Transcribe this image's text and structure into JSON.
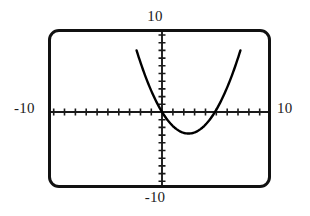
{
  "widget": {
    "name": "graphing-calculator-viewport",
    "frame_color": "#111111",
    "curve_color": "#000000",
    "axis_color": "#1a1a1a",
    "background": "#ffffff"
  },
  "labels": {
    "y_max": "10",
    "y_min": "-10",
    "x_min": "-10",
    "x_max": "10"
  },
  "chart_data": {
    "type": "line",
    "title": "",
    "subtitle": "",
    "xlabel": "",
    "ylabel": "",
    "xlim": [
      -10,
      10
    ],
    "ylim": [
      -10,
      10
    ],
    "x_tick_labels": [
      "-10",
      "10"
    ],
    "y_tick_labels": [
      "-10",
      "10"
    ],
    "xtick_step": 1,
    "ytick_step": 1,
    "grid": false,
    "legend": "none",
    "axes": {
      "x_axis_at_y": 0,
      "y_axis_at_x": 0,
      "tick_length_px": 5,
      "ticks_every_unit": true
    },
    "series": [
      {
        "name": "parabola",
        "shape": "upward-opening parabola",
        "equation": "y = 0.45x^2 - 2.25x",
        "vertex": [
          2.5,
          -2.8
        ],
        "roots": [
          0.0,
          5.0
        ],
        "leading_coefficient": 0.45,
        "x": [
          -1.9,
          -1.5,
          -1.0,
          -0.5,
          0.0,
          0.5,
          1.0,
          1.5,
          2.0,
          2.5,
          3.0,
          3.5,
          4.0,
          4.5,
          5.0,
          5.5,
          6.0,
          6.5,
          6.9
        ],
        "y": [
          5.9,
          4.4,
          2.7,
          1.2,
          0.0,
          -1.0,
          -1.8,
          -2.4,
          -2.7,
          -2.8,
          -2.7,
          -2.4,
          -1.8,
          -1.0,
          0.0,
          1.2,
          2.7,
          4.4,
          5.9
        ]
      }
    ]
  }
}
